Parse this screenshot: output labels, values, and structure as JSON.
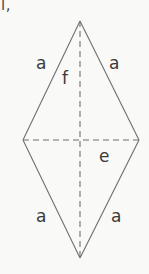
{
  "figure": {
    "name": "rhombus-with-diagonals",
    "type": "geometry-diagram",
    "background_color": "#f9f9f8",
    "stroke_color": "#6f6f6f",
    "text_color": "#3b3b3b",
    "canvas": {
      "width": 149,
      "height": 274
    },
    "corner_artifact": "l,",
    "vertices": {
      "top": {
        "x": 80,
        "y": 21
      },
      "right": {
        "x": 139,
        "y": 140
      },
      "bottom": {
        "x": 80,
        "y": 258
      },
      "left": {
        "x": 23,
        "y": 140
      }
    },
    "sides": [
      {
        "id": "side-top-left",
        "label": "a",
        "from": "top",
        "to": "left",
        "style": "solid"
      },
      {
        "id": "side-top-right",
        "label": "a",
        "from": "top",
        "to": "right",
        "style": "solid"
      },
      {
        "id": "side-bottom-left",
        "label": "a",
        "from": "left",
        "to": "bottom",
        "style": "solid"
      },
      {
        "id": "side-bottom-right",
        "label": "a",
        "from": "right",
        "to": "bottom",
        "style": "solid"
      }
    ],
    "diagonals": [
      {
        "id": "diagonal-vertical",
        "label": "f",
        "from": "top",
        "to": "bottom",
        "style": "dashed",
        "orientation": "vertical"
      },
      {
        "id": "diagonal-horizontal",
        "label": "e",
        "from": "left",
        "to": "right",
        "style": "dashed",
        "orientation": "horizontal"
      }
    ],
    "labels": {
      "a_top_left": "a",
      "a_top_right": "a",
      "a_bottom_left": "a",
      "a_bottom_right": "a",
      "f": "f",
      "e": "e"
    }
  }
}
